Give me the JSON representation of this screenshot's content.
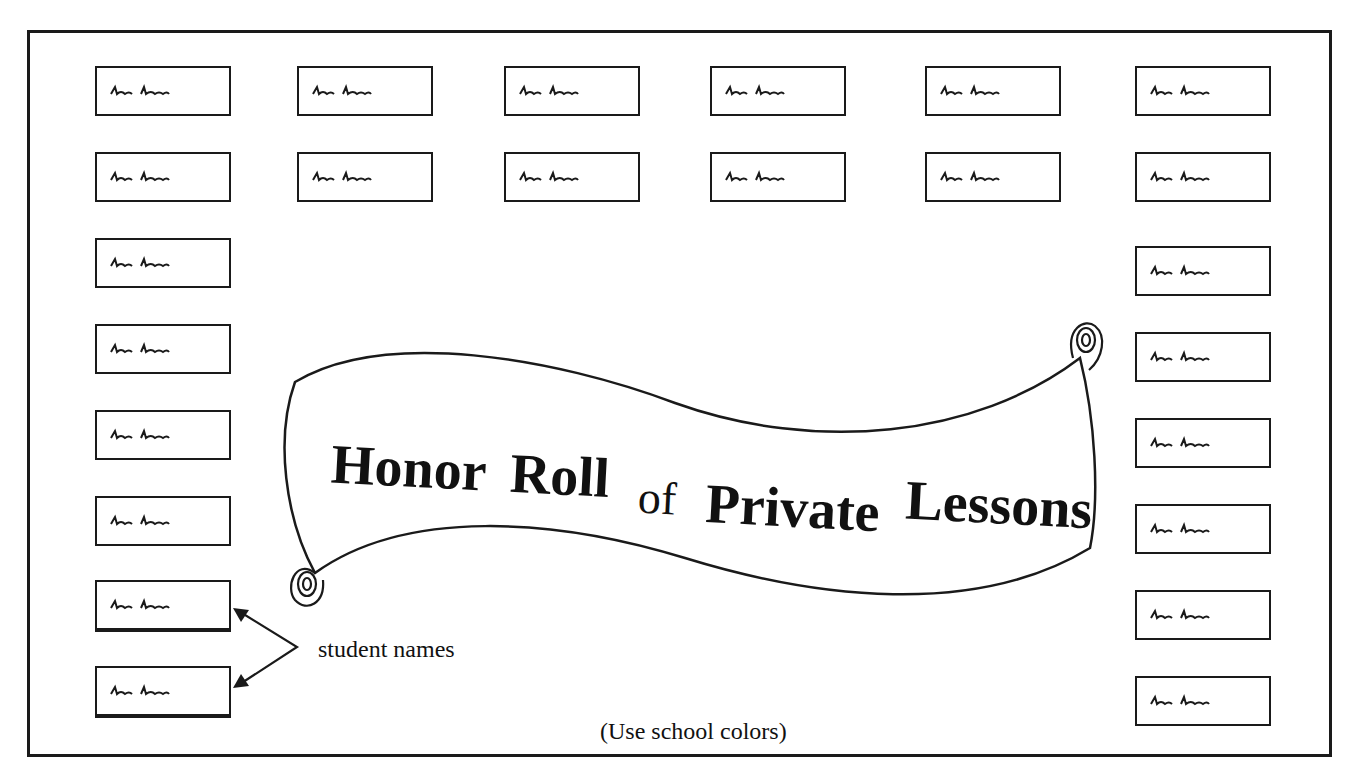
{
  "title": {
    "words": [
      "Honor",
      "Roll",
      "of",
      "Private",
      "Lessons"
    ],
    "full": "Honor Roll of Private Lessons"
  },
  "callout": {
    "label": "student names",
    "points_to": [
      "left-column box 7",
      "left-column box 8"
    ]
  },
  "note": "(Use school colors)",
  "name_boxes": {
    "top_rows": [
      [
        "handwritten name",
        "handwritten name",
        "handwritten name",
        "handwritten name",
        "handwritten name",
        "handwritten name"
      ],
      [
        "handwritten name",
        "handwritten name",
        "handwritten name",
        "handwritten name",
        "handwritten name",
        "handwritten name"
      ]
    ],
    "left_column_count": 8,
    "right_column_count": 8,
    "total": 24
  },
  "colors": {
    "ink": "#1a1a1a",
    "paper": "#ffffff"
  }
}
